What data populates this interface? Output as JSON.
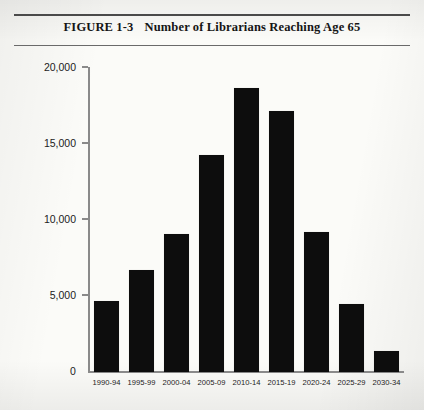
{
  "figure": {
    "number": "FIGURE 1-3",
    "title": "Number of Librarians Reaching Age 65"
  },
  "chart_data": {
    "type": "bar",
    "title": "Number of Librarians Reaching Age 65",
    "xlabel": "",
    "ylabel": "",
    "categories": [
      "1990-94",
      "1995-99",
      "2000-04",
      "2005-09",
      "2010-14",
      "2015-19",
      "2020-24",
      "2025-29",
      "2030-34"
    ],
    "values": [
      4700,
      6700,
      9100,
      14300,
      18700,
      17200,
      9200,
      4500,
      1400
    ],
    "ylim": [
      0,
      20000
    ],
    "ytick_labels": [
      "20,000",
      "15,000",
      "10,000",
      "5,000",
      "0"
    ],
    "ytick_values": [
      20000,
      15000,
      10000,
      5000,
      0
    ],
    "grid": false,
    "legend": null,
    "bar_color": "#0d0d0d"
  }
}
